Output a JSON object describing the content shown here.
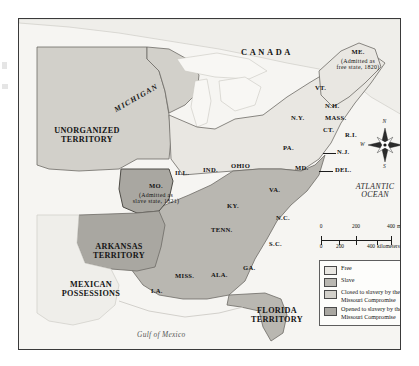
{
  "map": {
    "title_absent": true,
    "country_labels": [
      {
        "name": "canada",
        "text": "CANADA",
        "x": 248,
        "y": 38
      },
      {
        "name": "mexican-possessions",
        "text": "MEXICAN\nPOSSESSIONS",
        "x": 72,
        "y": 270
      }
    ],
    "water_labels": [
      {
        "name": "atlantic-ocean",
        "text": "ATLANTIC\nOCEAN",
        "x": 356,
        "y": 172
      },
      {
        "name": "gulf-of-mexico",
        "text": "Gulf of Mexico",
        "x": 152,
        "y": 318
      }
    ],
    "region_labels": [
      {
        "name": "unorganized-territory",
        "text": "UNORGANIZED\nTERRITORY",
        "x": 68,
        "y": 118
      },
      {
        "name": "arkansas-territory",
        "text": "ARKANSAS\nTERRITORY",
        "x": 100,
        "y": 232
      },
      {
        "name": "florida-territory",
        "text": "FLORIDA\nTERRITORY",
        "x": 258,
        "y": 296
      },
      {
        "name": "michigan-territory",
        "text": "MICHIGAN",
        "x": 118,
        "y": 80
      }
    ],
    "state_labels": [
      {
        "name": "maine",
        "text": "ME.",
        "x": 339,
        "y": 36
      },
      {
        "name": "vermont",
        "text": "VT.",
        "x": 303,
        "y": 72
      },
      {
        "name": "new-hampshire",
        "text": "N.H.",
        "x": 316,
        "y": 88
      },
      {
        "name": "massachusetts",
        "text": "MASS.",
        "x": 320,
        "y": 99
      },
      {
        "name": "connecticut",
        "text": "CT.",
        "x": 315,
        "y": 111
      },
      {
        "name": "rhode-island",
        "text": "R.I.",
        "x": 334,
        "y": 115
      },
      {
        "name": "new-york",
        "text": "N.Y.",
        "x": 284,
        "y": 101
      },
      {
        "name": "pennsylvania",
        "text": "PA.",
        "x": 275,
        "y": 130
      },
      {
        "name": "new-jersey",
        "text": "N.J.",
        "x": 322,
        "y": 133
      },
      {
        "name": "maryland",
        "text": "MD.",
        "x": 284,
        "y": 150
      },
      {
        "name": "delaware",
        "text": "DEL.",
        "x": 321,
        "y": 152
      },
      {
        "name": "ohio",
        "text": "OHIO",
        "x": 224,
        "y": 148
      },
      {
        "name": "indiana",
        "text": "IND.",
        "x": 192,
        "y": 152
      },
      {
        "name": "illinois",
        "text": "ILL.",
        "x": 163,
        "y": 155
      },
      {
        "name": "virginia",
        "text": "VA.",
        "x": 257,
        "y": 172
      },
      {
        "name": "kentucky",
        "text": "KY.",
        "x": 215,
        "y": 188
      },
      {
        "name": "north-carolina",
        "text": "N.C.",
        "x": 265,
        "y": 200
      },
      {
        "name": "tennessee",
        "text": "TENN.",
        "x": 204,
        "y": 212
      },
      {
        "name": "south-carolina",
        "text": "S.C.",
        "x": 258,
        "y": 226
      },
      {
        "name": "georgia",
        "text": "GA.",
        "x": 232,
        "y": 250
      },
      {
        "name": "alabama",
        "text": "ALA.",
        "x": 202,
        "y": 257
      },
      {
        "name": "mississippi",
        "text": "MISS.",
        "x": 168,
        "y": 258
      },
      {
        "name": "louisiana",
        "text": "LA.",
        "x": 140,
        "y": 273
      },
      {
        "name": "missouri",
        "text": "MO.",
        "x": 137,
        "y": 170
      }
    ],
    "annotations": [
      {
        "name": "maine-note",
        "text": "(Admitted as\nfree state, 1820)",
        "x": 339,
        "y": 44
      },
      {
        "name": "missouri-note",
        "text": "(Admitted as\nslave state, 1821)",
        "x": 137,
        "y": 178
      }
    ]
  },
  "compass": {
    "north": "N",
    "east": "E",
    "south": "S",
    "west": "W"
  },
  "scale": {
    "miles": {
      "ticks": [
        "0",
        "200",
        "400"
      ],
      "unit": "miles"
    },
    "kilometers": {
      "ticks": [
        "0",
        "200",
        "400"
      ],
      "unit": "kilometers"
    }
  },
  "legend": {
    "items": [
      {
        "name": "legend-free",
        "label": "Free",
        "color": "#e9e7e2"
      },
      {
        "name": "legend-slave",
        "label": "Slave",
        "color": "#b9b7b1"
      },
      {
        "name": "legend-closed",
        "label": "Closed to slavery by the\nMissouri Compromise",
        "color": "#d2d0ca"
      },
      {
        "name": "legend-opened",
        "label": "Opened to slavery by the\nMissouri Compromise",
        "color": "#a9a7a1"
      }
    ]
  },
  "colors": {
    "free": "#e9e7e2",
    "slave": "#b9b7b1",
    "closed": "#d2d0ca",
    "opened": "#a9a7a1",
    "water": "#f6f5f2",
    "border": "#3a3a3a",
    "ink": "#141414"
  }
}
